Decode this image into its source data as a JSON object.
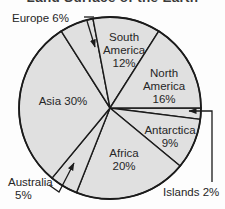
{
  "chart_data": {
    "type": "pie",
    "title": "Land Surface of the Earth",
    "title_note": "title is clipped at top edge of screenshot",
    "unit": "%",
    "start_angle_deg": 0,
    "direction": "clockwise",
    "slices": [
      {
        "label": "Islands",
        "value": 2,
        "text": "Islands 2%",
        "label_lines": [
          "Islands 2%"
        ],
        "label_position": "outside-bottom-right",
        "leader": "arrow"
      },
      {
        "label": "Antarctica",
        "value": 9,
        "text": "Antarctica 9%",
        "label_lines": [
          "Antarctica",
          "9%"
        ],
        "label_position": "inside"
      },
      {
        "label": "Africa",
        "value": 20,
        "text": "Africa 20%",
        "label_lines": [
          "Africa",
          "20%"
        ],
        "label_position": "inside"
      },
      {
        "label": "Australia",
        "value": 5,
        "text": "Australia 5%",
        "label_lines": [
          "Australia",
          "5%"
        ],
        "label_position": "outside-bottom-left",
        "leader": "arrow"
      },
      {
        "label": "Asia",
        "value": 30,
        "text": "Asia 30%",
        "label_lines": [
          "Asia 30%"
        ],
        "label_position": "inside"
      },
      {
        "label": "Europe",
        "value": 6,
        "text": "Europe 6%",
        "label_lines": [
          "Europe 6%"
        ],
        "label_position": "outside-top-left",
        "leader": "arrow"
      },
      {
        "label": "South America",
        "value": 12,
        "text": "South America 12%",
        "label_lines": [
          "South",
          "America",
          "12%"
        ],
        "label_position": "inside"
      },
      {
        "label": "North America",
        "value": 16,
        "text": "North America 16%",
        "label_lines": [
          "North",
          "America",
          "16%"
        ],
        "label_position": "inside"
      }
    ],
    "colors": {
      "slice_fill": "#e0e0e0",
      "outline": "#1b1b1b",
      "text": "#262626",
      "background": "#fdfdfd"
    },
    "legend": "none",
    "total": 100
  }
}
